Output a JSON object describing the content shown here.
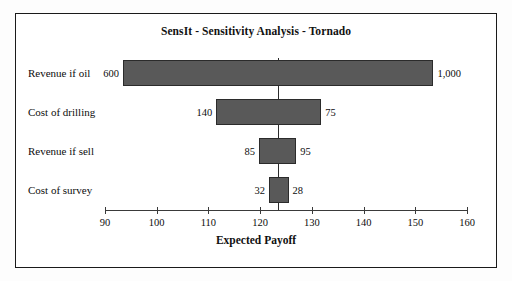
{
  "chart_data": {
    "type": "bar",
    "subtype": "tornado",
    "title": "SensIt - Sensitivity Analysis - Tornado",
    "xlabel": "Expected Payoff",
    "ylabel": "",
    "xlim": [
      90,
      160
    ],
    "xticks": [
      90,
      100,
      110,
      120,
      130,
      140,
      150,
      160
    ],
    "xtick_labels": [
      "90",
      "100",
      "110",
      "120",
      "130",
      "140",
      "150",
      "160"
    ],
    "grid": false,
    "legend": "none",
    "base_value": 123.5,
    "bar_color": "#595959",
    "bar_border_color": "#2b2b2b",
    "frame_color": "#1a1a1a",
    "categories": [
      "Revenue if oil",
      "Cost of drilling",
      "Revenue if sell",
      "Cost of survey"
    ],
    "bars": [
      {
        "label": "Revenue if oil",
        "low_label": "600",
        "high_label": "1,000",
        "payoff_low": 93.5,
        "payoff_high": 153.5
      },
      {
        "label": "Cost of drilling",
        "low_label": "140",
        "high_label": "75",
        "payoff_low": 111.5,
        "payoff_high": 131.8
      },
      {
        "label": "Revenue if sell",
        "low_label": "85",
        "high_label": "95",
        "payoff_low": 119.8,
        "payoff_high": 127.0
      },
      {
        "label": "Cost of survey",
        "low_label": "32",
        "high_label": "28",
        "payoff_low": 121.7,
        "payoff_high": 125.5
      }
    ]
  }
}
